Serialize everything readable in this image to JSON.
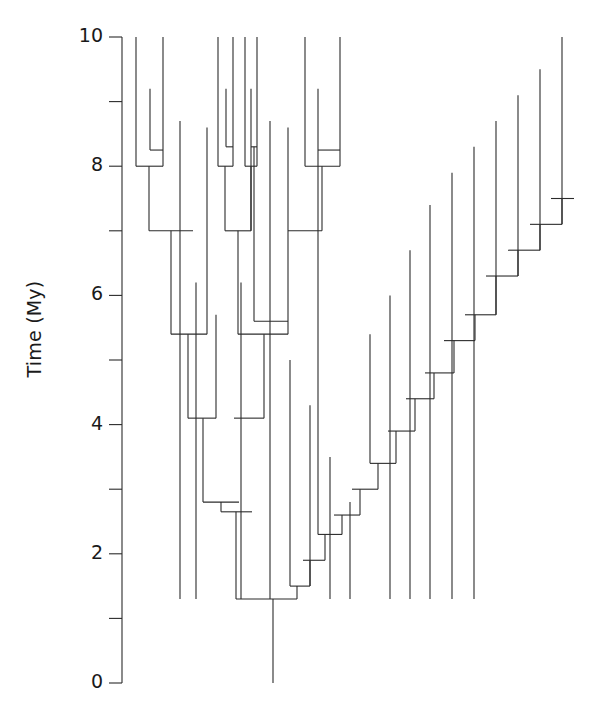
{
  "figure": {
    "type": "phylogenetic-tree",
    "orientation": "tips-up",
    "background_color": "#ffffff",
    "line_color": "#2b2b2b",
    "line_width": 1.1
  },
  "axis": {
    "label": "Time (My)",
    "units": "My",
    "major_ticks": [
      10,
      8,
      6,
      4,
      2,
      0
    ],
    "major_tick_labels": [
      "10",
      "8",
      "6",
      "4",
      "2",
      "0"
    ],
    "minor_ticks": [
      9,
      7,
      5,
      3,
      1
    ],
    "range": [
      0,
      10
    ],
    "direction": "decreasing-downward",
    "spine_x_px": 122,
    "y_at_max_px": 37,
    "y_at_min_px": 683
  },
  "chart_data": {
    "type": "tree",
    "title": "",
    "xlabel": "",
    "ylabel": "Time (My)",
    "ylim": [
      0,
      10
    ],
    "grid": false,
    "legend": "none",
    "tip_count": 32,
    "node_count": 31,
    "root_age": 1.3,
    "root_stem_base": 0.0,
    "tips": [
      {
        "id": "t1",
        "x_px": 136,
        "age": 10.0
      },
      {
        "id": "t2",
        "x_px": 163,
        "age": 10.0
      },
      {
        "id": "t3",
        "x_px": 150,
        "age": 9.2
      },
      {
        "id": "t4",
        "x_px": 218,
        "age": 10.0
      },
      {
        "id": "t5",
        "x_px": 233,
        "age": 10.0
      },
      {
        "id": "t6",
        "x_px": 226,
        "age": 9.2
      },
      {
        "id": "t7",
        "x_px": 245,
        "age": 10.0
      },
      {
        "id": "t8",
        "x_px": 257,
        "age": 10.0
      },
      {
        "id": "t9",
        "x_px": 251,
        "age": 9.2
      },
      {
        "id": "t10",
        "x_px": 305,
        "age": 10.0
      },
      {
        "id": "t11",
        "x_px": 340,
        "age": 10.0
      },
      {
        "id": "t12",
        "x_px": 318,
        "age": 9.2
      },
      {
        "id": "t13",
        "x_px": 180,
        "age": 8.7
      },
      {
        "id": "t14",
        "x_px": 207,
        "age": 8.6
      },
      {
        "id": "t15",
        "x_px": 270,
        "age": 8.7
      },
      {
        "id": "t16",
        "x_px": 288,
        "age": 8.6
      },
      {
        "id": "t17",
        "x_px": 196,
        "age": 6.2
      },
      {
        "id": "t18",
        "x_px": 241,
        "age": 6.2
      },
      {
        "id": "t19",
        "x_px": 216,
        "age": 5.7
      },
      {
        "id": "t20",
        "x_px": 254,
        "age": 5.6
      },
      {
        "id": "t21",
        "x_px": 290,
        "age": 5.0
      },
      {
        "id": "t22",
        "x_px": 310,
        "age": 4.3
      },
      {
        "id": "t23",
        "x_px": 330,
        "age": 3.5
      },
      {
        "id": "t24",
        "x_px": 350,
        "age": 2.8
      },
      {
        "id": "t25",
        "x_px": 370,
        "age": 5.4
      },
      {
        "id": "t26",
        "x_px": 390,
        "age": 6.0
      },
      {
        "id": "t27",
        "x_px": 410,
        "age": 6.7
      },
      {
        "id": "t28",
        "x_px": 430,
        "age": 7.4
      },
      {
        "id": "t29",
        "x_px": 452,
        "age": 7.9
      },
      {
        "id": "t30",
        "x_px": 474,
        "age": 8.3
      },
      {
        "id": "t31",
        "x_px": 496,
        "age": 8.7
      },
      {
        "id": "t32",
        "x_px": 518,
        "age": 9.1
      },
      {
        "id": "t33",
        "x_px": 540,
        "age": 9.5
      },
      {
        "id": "t34",
        "x_px": 562,
        "age": 10.0
      }
    ],
    "nodes": [
      {
        "id": "n_root",
        "age": 1.3,
        "x_px": 273,
        "children_x_px": [
          236,
          297
        ]
      },
      {
        "id": "n_lad1",
        "age": 1.5,
        "x_px": 297,
        "children_x_px": [
          290,
          310
        ]
      },
      {
        "id": "n_lad2",
        "age": 1.9,
        "x_px": 310,
        "children_x_px": [
          303,
          325
        ]
      },
      {
        "id": "n_lad3",
        "age": 2.3,
        "x_px": 325,
        "children_x_px": [
          318,
          342
        ]
      },
      {
        "id": "n_lad4",
        "age": 2.6,
        "x_px": 342,
        "children_x_px": [
          334,
          360
        ]
      },
      {
        "id": "n_lad5",
        "age": 3.0,
        "x_px": 360,
        "children_x_px": [
          352,
          378
        ]
      },
      {
        "id": "n_lad6",
        "age": 3.4,
        "x_px": 378,
        "children_x_px": [
          370,
          396
        ]
      },
      {
        "id": "n_lad7",
        "age": 3.9,
        "x_px": 396,
        "children_x_px": [
          388,
          415
        ]
      },
      {
        "id": "n_lad8",
        "age": 4.4,
        "x_px": 415,
        "children_x_px": [
          406,
          434
        ]
      },
      {
        "id": "n_lad9",
        "age": 4.8,
        "x_px": 434,
        "children_x_px": [
          425,
          454
        ]
      },
      {
        "id": "n_lad10",
        "age": 5.3,
        "x_px": 454,
        "children_x_px": [
          444,
          475
        ]
      },
      {
        "id": "n_lad11",
        "age": 5.7,
        "x_px": 475,
        "children_x_px": [
          465,
          496
        ]
      },
      {
        "id": "n_lad12",
        "age": 6.3,
        "x_px": 496,
        "children_x_px": [
          486,
          518
        ]
      },
      {
        "id": "n_lad13",
        "age": 6.7,
        "x_px": 518,
        "children_x_px": [
          508,
          540
        ]
      },
      {
        "id": "n_lad14",
        "age": 7.1,
        "x_px": 540,
        "children_x_px": [
          530,
          562
        ]
      },
      {
        "id": "n_lad15",
        "age": 7.5,
        "x_px": 562,
        "children_x_px": [
          551,
          574
        ]
      },
      {
        "id": "n_L8a",
        "age": 8.0,
        "x_px": 149,
        "children_x_px": [
          136,
          163
        ]
      },
      {
        "id": "n_L82",
        "age": 8.25,
        "x_px": 157,
        "children_x_px": [
          150,
          163
        ]
      },
      {
        "id": "n_L7",
        "age": 7.0,
        "x_px": 171,
        "children_x_px": [
          149,
          193
        ]
      },
      {
        "id": "n_L54",
        "age": 5.4,
        "x_px": 188,
        "children_x_px": [
          171,
          207
        ]
      },
      {
        "id": "n_L41",
        "age": 4.1,
        "x_px": 203,
        "children_x_px": [
          188,
          216
        ]
      },
      {
        "id": "n_L28",
        "age": 2.8,
        "x_px": 221,
        "children_x_px": [
          203,
          239
        ]
      },
      {
        "id": "n_L26",
        "age": 2.65,
        "x_px": 236,
        "children_x_px": [
          221,
          252
        ]
      },
      {
        "id": "n_M8a",
        "age": 8.0,
        "x_px": 225,
        "children_x_px": [
          218,
          233
        ]
      },
      {
        "id": "n_M82",
        "age": 8.3,
        "x_px": 229,
        "children_x_px": [
          226,
          233
        ]
      },
      {
        "id": "n_M8b",
        "age": 8.0,
        "x_px": 251,
        "children_x_px": [
          245,
          257
        ]
      },
      {
        "id": "n_M83",
        "age": 8.3,
        "x_px": 254,
        "children_x_px": [
          251,
          257
        ]
      },
      {
        "id": "n_M7",
        "age": 7.0,
        "x_px": 238,
        "children_x_px": [
          225,
          251
        ]
      },
      {
        "id": "n_R8",
        "age": 8.0,
        "x_px": 322,
        "children_x_px": [
          305,
          340
        ]
      },
      {
        "id": "n_R82",
        "age": 8.25,
        "x_px": 329,
        "children_x_px": [
          318,
          340
        ]
      },
      {
        "id": "n_R7",
        "age": 7.0,
        "x_px": 306,
        "children_x_px": [
          288,
          322
        ]
      },
      {
        "id": "n_M54",
        "age": 5.4,
        "x_px": 264,
        "children_x_px": [
          238,
          288
        ]
      },
      {
        "id": "n_M41",
        "age": 4.1,
        "x_px": 249,
        "children_x_px": [
          234,
          264
        ]
      },
      {
        "id": "n_M56",
        "age": 5.6,
        "x_px": 270,
        "children_x_px": [
          254,
          288
        ]
      }
    ]
  }
}
